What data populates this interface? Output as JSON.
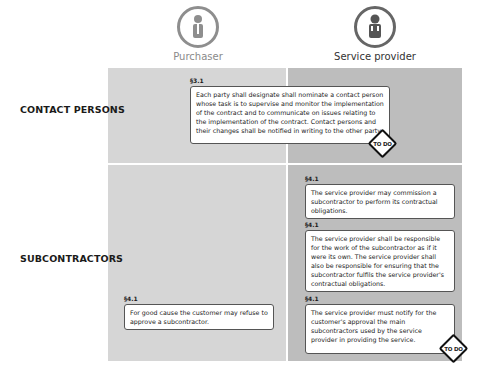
{
  "roles": [
    {
      "label": "Purchaser",
      "icon": "person-icon"
    },
    {
      "label": "Service provider",
      "icon": "person-icon"
    }
  ],
  "rows": [
    {
      "label": "CONTACT PERSONS"
    },
    {
      "label": "SUBCONTRACTORS"
    }
  ],
  "clauses": [
    {
      "ref": "§3.1",
      "text": "Each party shall designate shall nominate a contact person whose task is to supervise and monitor the implementation of the contract and to communicate on issues relating to the implementation of the contract. Contact persons and their changes shall be notified in writing to the other party.",
      "todo": "TO DO"
    },
    {
      "ref": "§4.1",
      "text": "The service provider may commission a subcontractor to perform its contractual obligations."
    },
    {
      "ref": "§4.1",
      "text": "The service provider shall be responsible for the work of the subcontractor as if it were its own. The service provider shall also be responsible for ensuring that the subcontractor fulfils the service provider's contractual obligations."
    },
    {
      "ref": "§4.1",
      "text": "For good cause the customer may refuse to approve a subcontractor."
    },
    {
      "ref": "§4.1",
      "text": "The service provider must notify for the customer's approval the main subcontractors used by the service provider in providing the service.",
      "todo": "TO DO"
    }
  ]
}
